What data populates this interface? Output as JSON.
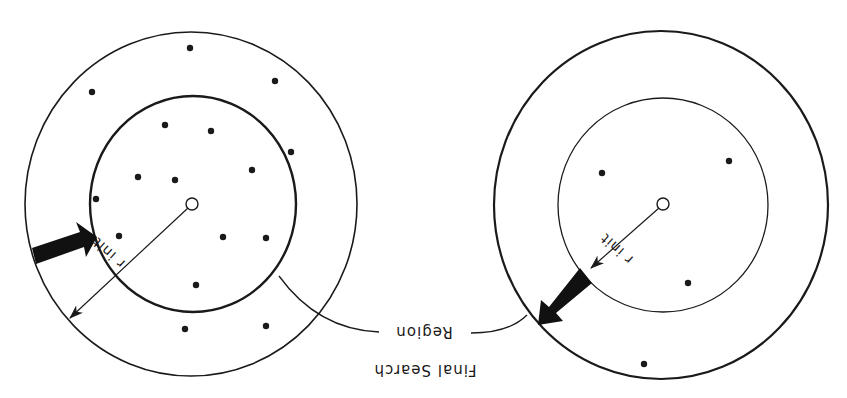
{
  "figure": {
    "orientation": "rotated-180",
    "colors": {
      "stroke": "#1a1a1a",
      "background": "#ffffff"
    },
    "caption_label": {
      "line1": "Final Search",
      "line2": "Region"
    },
    "panels": [
      {
        "id": "left",
        "radius_label": "r init",
        "center": [
          192,
          204
        ],
        "outer": {
          "cx": 191,
          "cy": 204,
          "rx": 166,
          "ry": 172
        },
        "inner": {
          "cx": 193,
          "cy": 204,
          "rx": 103,
          "ry": 108
        },
        "points": [
          [
            190,
            48
          ],
          [
            92,
            92
          ],
          [
            275,
            81
          ],
          [
            165,
            125
          ],
          [
            211,
            131
          ],
          [
            291,
            152
          ],
          [
            252,
            170
          ],
          [
            138,
            177
          ],
          [
            175,
            180
          ],
          [
            96,
            199
          ],
          [
            119,
            236
          ],
          [
            223,
            237
          ],
          [
            266,
            238
          ],
          [
            196,
            285
          ],
          [
            185,
            329
          ],
          [
            266,
            326
          ]
        ]
      },
      {
        "id": "right",
        "radius_label": "r init",
        "center": [
          663,
          205
        ],
        "outer": {
          "cx": 661,
          "cy": 205,
          "rx": 167,
          "ry": 174
        },
        "inner": {
          "cx": 663,
          "cy": 205,
          "rx": 105,
          "ry": 107
        },
        "points": [
          [
            602,
            173
          ],
          [
            729,
            161
          ],
          [
            688,
            283
          ],
          [
            644,
            364
          ]
        ]
      }
    ]
  }
}
